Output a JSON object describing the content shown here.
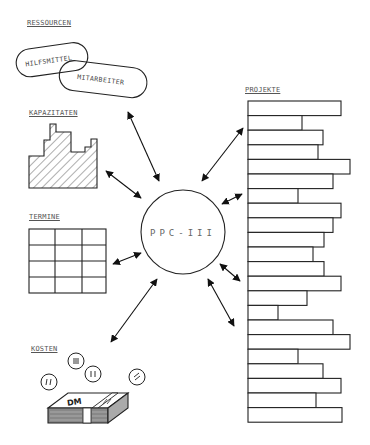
{
  "diagram": {
    "center": {
      "label": "PPC-III"
    },
    "sections": {
      "ressourcen": {
        "label": "RESSOURCEN",
        "items": [
          "HILFSMITTEL",
          "MITARBEITER"
        ]
      },
      "kapazitaeten": {
        "label": "KAPAZITATEN"
      },
      "termine": {
        "label": "TERMINE",
        "grid_rows": 4,
        "grid_cols": 3
      },
      "kosten": {
        "label": "KOSTEN",
        "money_label": "DM"
      },
      "projekte": {
        "label": "PROJEKTE",
        "bar_count": 22,
        "bar_right_edges": [
          341,
          302,
          323,
          318,
          350,
          333,
          298,
          341,
          333,
          324,
          313,
          324,
          341,
          307,
          278,
          333,
          350,
          298,
          323,
          341,
          316,
          342
        ]
      }
    },
    "arrows": [
      {
        "from": "ressourcen",
        "to": "center",
        "type": "bidirectional"
      },
      {
        "from": "kapazitaeten",
        "to": "center",
        "type": "bidirectional"
      },
      {
        "from": "termine",
        "to": "center",
        "type": "bidirectional"
      },
      {
        "from": "kosten",
        "to": "center",
        "type": "bidirectional"
      },
      {
        "from": "projekte",
        "to": "center",
        "type": "bidirectional",
        "count": 5
      }
    ],
    "colors": {
      "stroke": "#222222",
      "text": "#555555",
      "background": "#ffffff"
    }
  }
}
